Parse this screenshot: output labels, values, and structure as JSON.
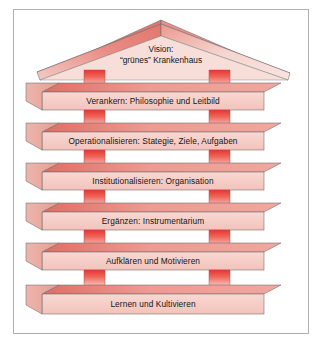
{
  "diagram": {
    "kind": "pyramid-house-diagram",
    "background_color": "#ffffff",
    "frame_color": "#b0b0b0",
    "beam_top_color": "#e8837c",
    "beam_front_color": "#f6cfc9",
    "beam_side_color": "#eba99f",
    "pillar_color": "#e8403a",
    "outline_color": "#555555",
    "roof": {
      "line1": "Vision:",
      "line2": "“grünes” Krankenhaus"
    },
    "levels": [
      {
        "label": "Verankern: Philosophie und Leitbild"
      },
      {
        "label": "Operationalisieren: Stategie, Ziele, Aufgaben"
      },
      {
        "label": "Institutionalisieren: Organisation"
      },
      {
        "label": "Ergänzen: Instrumentarium"
      },
      {
        "label": "Aufklären und Motivieren"
      },
      {
        "label": "Lernen und Kultivieren"
      }
    ]
  }
}
